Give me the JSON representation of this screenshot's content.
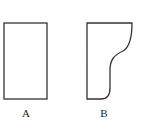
{
  "diagram": {
    "shapes": [
      {
        "id": "A",
        "label": "A",
        "kind": "rectangle"
      },
      {
        "id": "B",
        "label": "B",
        "kind": "curved-profile"
      }
    ],
    "stroke_color": "#333333",
    "background": "#ffffff"
  }
}
